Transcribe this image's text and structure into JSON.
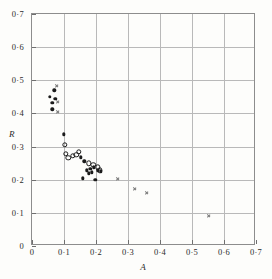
{
  "chart_data": {
    "type": "scatter",
    "title": "",
    "xlabel": "A",
    "ylabel": "R",
    "xlim": [
      0,
      0.7
    ],
    "ylim": [
      0,
      0.7
    ],
    "grid": true,
    "legend": "none",
    "x_ticks": [
      "0",
      "0·1",
      "0·2",
      "0·3",
      "0·4",
      "0·5",
      "0·6",
      "0·7"
    ],
    "x_tick_values": [
      0,
      0.1,
      0.2,
      0.3,
      0.4,
      0.5,
      0.6,
      0.7
    ],
    "y_ticks": [
      "0",
      "0·1",
      "0·2",
      "0·3",
      "0·4",
      "0·5",
      "0·6",
      "0·7"
    ],
    "y_tick_values": [
      0,
      0.1,
      0.2,
      0.3,
      0.4,
      0.5,
      0.6,
      0.7
    ],
    "series": [
      {
        "name": "filled-circles",
        "marker": "filled-circle",
        "color": "#1b1b1b",
        "points": [
          [
            0.055,
            0.45
          ],
          [
            0.063,
            0.432
          ],
          [
            0.064,
            0.412
          ],
          [
            0.07,
            0.47
          ],
          [
            0.073,
            0.445
          ],
          [
            0.1,
            0.337
          ],
          [
            0.152,
            0.268
          ],
          [
            0.163,
            0.255
          ],
          [
            0.158,
            0.204
          ],
          [
            0.172,
            0.228
          ],
          [
            0.178,
            0.219
          ],
          [
            0.182,
            0.232
          ],
          [
            0.186,
            0.222
          ],
          [
            0.193,
            0.237
          ],
          [
            0.198,
            0.2
          ],
          [
            0.205,
            0.228
          ],
          [
            0.215,
            0.225
          ]
        ]
      },
      {
        "name": "open-circles",
        "marker": "open-circle",
        "color": "#1b1b1b",
        "points": [
          [
            0.103,
            0.305
          ],
          [
            0.105,
            0.278
          ],
          [
            0.113,
            0.266
          ],
          [
            0.128,
            0.272
          ],
          [
            0.138,
            0.275
          ],
          [
            0.146,
            0.285
          ],
          [
            0.178,
            0.25
          ],
          [
            0.192,
            0.245
          ],
          [
            0.205,
            0.238
          ],
          [
            0.212,
            0.228
          ]
        ]
      },
      {
        "name": "cross-marks",
        "marker": "cross",
        "color": "#7a7a7a",
        "points": [
          [
            0.079,
            0.483
          ],
          [
            0.081,
            0.436
          ],
          [
            0.082,
            0.405
          ],
          [
            0.268,
            0.203
          ],
          [
            0.322,
            0.173
          ],
          [
            0.358,
            0.161
          ],
          [
            0.552,
            0.09
          ]
        ]
      }
    ]
  }
}
